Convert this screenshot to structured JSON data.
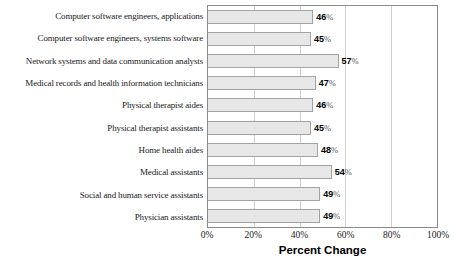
{
  "chart_data": {
    "type": "bar",
    "orientation": "horizontal",
    "title": "",
    "xlabel": "Percent Change",
    "ylabel": "",
    "xlim": [
      0,
      100
    ],
    "x_ticks": [
      "0%",
      "20%",
      "40%",
      "60%",
      "80%",
      "100%"
    ],
    "grid": "vertical gridlines at 20% intervals, drawn behind bars",
    "legend": "none",
    "categories": [
      "Computer software engineers, applications",
      "Computer software engineers, systems software",
      "Network systems and data communication analysts",
      "Medical records and health information technicians",
      "Physical therapist aides",
      "Physical therapist assistants",
      "Home health aides",
      "Medical assistants",
      "Social and human service assistants",
      "Physician assistants"
    ],
    "values": [
      46,
      45,
      57,
      47,
      46,
      45,
      48,
      54,
      49,
      49
    ],
    "value_suffix": "%",
    "colors": {
      "bar_fill": "#e7e7e7",
      "bar_border": "#a3a3a3",
      "plot_border": "#8a8a8a",
      "gridline": "#cfcfcf",
      "text": "#000000"
    }
  }
}
